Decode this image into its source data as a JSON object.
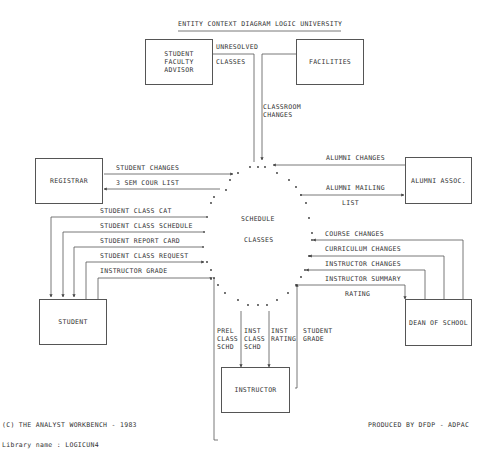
{
  "title": "ENTITY CONTEXT DIAGRAM  LOGIC UNIVERSITY",
  "entities": {
    "sfa": "STUDENT\nFACULTY\nADVISOR",
    "facilities": "FACILITIES",
    "registrar": "REGISTRAR",
    "alumni": "ALUMNI ASSOC.",
    "student": "STUDENT",
    "dean": "DEAN OF SCHOOL",
    "instructor": "INSTRUCTOR"
  },
  "process": {
    "line1": "SCHEDULE",
    "line2": "CLASSES"
  },
  "flows": {
    "unresolved1": "UNRESOLVED",
    "unresolved2": "CLASSES",
    "classroom1": "CLASSROOM",
    "classroom2": "CHANGES",
    "student_changes": "STUDENT CHANGES",
    "sem_cour_list": "3 SEM COUR LIST",
    "alumni_changes": "ALUMNI CHANGES",
    "alumni_mailing1": "ALUMNI MAILING",
    "alumni_mailing2": "LIST",
    "student_class_cat": "STUDENT CLASS CAT",
    "student_class_schedule": "STUDENT CLASS SCHEDULE",
    "student_report_card": "STUDENT REPORT CARD",
    "student_class_request": "STUDENT CLASS REQUEST",
    "instructor_grade": "INSTRUCTOR GRADE",
    "course_changes": "COURSE CHANGES",
    "curriculum_changes": "CURRICULUM CHANGES",
    "instructor_changes": "INSTRUCTOR CHANGES",
    "instructor_summary": "INSTRUCTOR SUMMARY",
    "rating": "RATING",
    "prel1": "PREL",
    "prel2": "CLASS",
    "prel3": "SCHD",
    "instclass1": "INST",
    "instclass2": "CLASS",
    "instclass3": "SCHD",
    "instrating1": "INST",
    "instrating2": "RATING",
    "studentgrade1": "STUDENT",
    "studentgrade2": "GRADE"
  },
  "footer": {
    "copyright": "(C) THE ANALYST WORKBENCH - 1983",
    "produced": "PRODUCED BY DFDP - ADPAC",
    "library": "Library name : LOGICUN4"
  }
}
